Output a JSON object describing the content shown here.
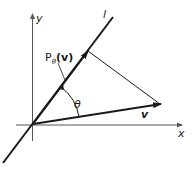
{
  "diagram": {
    "type": "vector projection onto a line",
    "labels": {
      "y_axis": "y",
      "x_axis": "x",
      "line": "l",
      "projection_P": "P",
      "projection_sub": "θ",
      "projection_arg": "(v)",
      "angle": "θ",
      "vector": "v"
    },
    "colors": {
      "axis": "#555555",
      "line": "#1a1a1a",
      "background": "#ffffff"
    }
  }
}
